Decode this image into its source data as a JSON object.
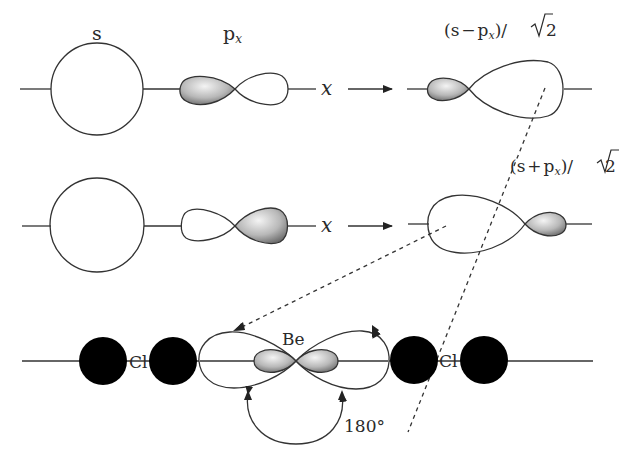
{
  "labels": {
    "s": "s",
    "px_base": "p",
    "px_sub": "x",
    "axis_x1": "x",
    "axis_x2": "x",
    "hybrid_minus_open": "(s",
    "hybrid_minus_op": "−",
    "hybrid_minus_p": "p",
    "hybrid_minus_sub": "x",
    "hybrid_minus_close": ")/",
    "hybrid_minus_two": "2",
    "hybrid_plus_open": "(s",
    "hybrid_plus_op": "+",
    "hybrid_plus_p": "p",
    "hybrid_plus_sub": "x",
    "hybrid_plus_close": ")/",
    "hybrid_plus_two": "2",
    "be": "Be",
    "cl_left": "Cl",
    "cl_right": "Cl",
    "angle": "180°"
  },
  "colors": {
    "line": "#333333",
    "shade_light": "#f2f2f2",
    "shade_dark": "#6e6e6e",
    "atom": "#000000"
  }
}
